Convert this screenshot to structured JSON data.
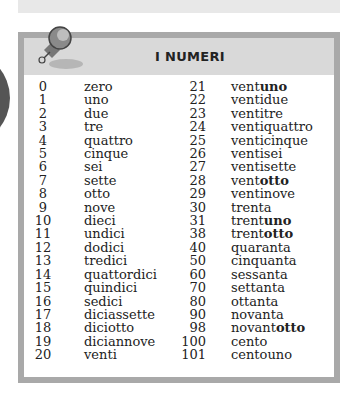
{
  "title": "I NUMERI",
  "colors": {
    "border": "#a9a9a9",
    "header_bg": "#d9d9d9",
    "text": "#222222"
  },
  "left_column": [
    {
      "n": "0",
      "w": "zero"
    },
    {
      "n": "1",
      "w": "uno"
    },
    {
      "n": "2",
      "w": "due"
    },
    {
      "n": "3",
      "w": "tre"
    },
    {
      "n": "4",
      "w": "quattro"
    },
    {
      "n": "5",
      "w": "cinque"
    },
    {
      "n": "6",
      "w": "sei"
    },
    {
      "n": "7",
      "w": "sette"
    },
    {
      "n": "8",
      "w": "otto"
    },
    {
      "n": "9",
      "w": "nove"
    },
    {
      "n": "10",
      "w": "dieci"
    },
    {
      "n": "11",
      "w": "undici"
    },
    {
      "n": "12",
      "w": "dodici"
    },
    {
      "n": "13",
      "w": "tredici"
    },
    {
      "n": "14",
      "w": "quattordici"
    },
    {
      "n": "15",
      "w": "quindici"
    },
    {
      "n": "16",
      "w": "sedici"
    },
    {
      "n": "17",
      "w": "diciassette"
    },
    {
      "n": "18",
      "w": "diciotto"
    },
    {
      "n": "19",
      "w": "diciannove"
    },
    {
      "n": "20",
      "w": "venti"
    }
  ],
  "right_column": [
    {
      "n": "21",
      "stem": "vent",
      "bold": "uno"
    },
    {
      "n": "22",
      "stem": "ventidue",
      "bold": ""
    },
    {
      "n": "23",
      "stem": "ventitre",
      "bold": ""
    },
    {
      "n": "24",
      "stem": "ventiquattro",
      "bold": ""
    },
    {
      "n": "25",
      "stem": "venticinque",
      "bold": ""
    },
    {
      "n": "26",
      "stem": "ventisei",
      "bold": ""
    },
    {
      "n": "27",
      "stem": "ventisette",
      "bold": ""
    },
    {
      "n": "28",
      "stem": "vent",
      "bold": "otto"
    },
    {
      "n": "29",
      "stem": "ventinove",
      "bold": ""
    },
    {
      "n": "30",
      "stem": "trenta",
      "bold": ""
    },
    {
      "n": "31",
      "stem": "trent",
      "bold": "uno"
    },
    {
      "n": "38",
      "stem": "trent",
      "bold": "otto"
    },
    {
      "n": "40",
      "stem": "quaranta",
      "bold": ""
    },
    {
      "n": "50",
      "stem": "cinquanta",
      "bold": ""
    },
    {
      "n": "60",
      "stem": "sessanta",
      "bold": ""
    },
    {
      "n": "70",
      "stem": "settanta",
      "bold": ""
    },
    {
      "n": "80",
      "stem": "ottanta",
      "bold": ""
    },
    {
      "n": "90",
      "stem": "novanta",
      "bold": ""
    },
    {
      "n": "98",
      "stem": "novant",
      "bold": "otto"
    },
    {
      "n": "100",
      "stem": "cento",
      "bold": ""
    },
    {
      "n": "101",
      "stem": "centouno",
      "bold": ""
    }
  ],
  "icons": {
    "pin": "pushpin-icon"
  }
}
